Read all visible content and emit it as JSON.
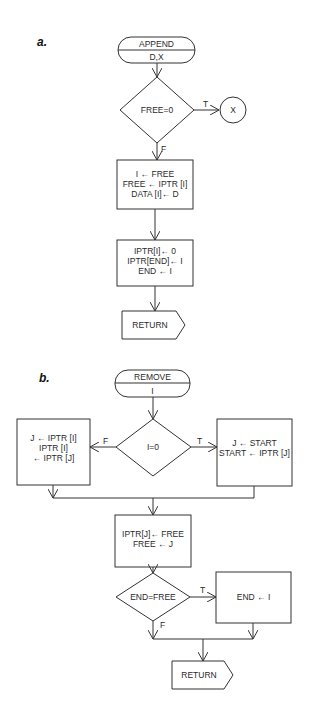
{
  "diagram_a": {
    "label": "a.",
    "start": {
      "title": "APPEND",
      "params": "D,X"
    },
    "decision": {
      "text": "FREE=0",
      "true_label": "T",
      "false_label": "F"
    },
    "connector": {
      "text": "X"
    },
    "box1": {
      "lines": [
        "I ← FREE",
        "FREE ← IPTR [I]",
        "DATA [I]← D"
      ]
    },
    "box2": {
      "lines": [
        "IPTR[I]← 0",
        "IPTR[END]← I",
        "END ← I"
      ]
    },
    "end": {
      "text": "RETURN"
    }
  },
  "diagram_b": {
    "label": "b.",
    "start": {
      "title": "REMOVE",
      "params": "I"
    },
    "decision1": {
      "text": "I=0",
      "true_label": "T",
      "false_label": "F"
    },
    "false_box": {
      "lines": [
        "J ← IPTR [I]",
        "IPTR [I]",
        "← IPTR [J]"
      ]
    },
    "true_box": {
      "lines": [
        "J ← START",
        "START ← IPTR [J]"
      ]
    },
    "box3": {
      "lines": [
        "IPTR[J]← FREE",
        "FREE ← J"
      ]
    },
    "decision2": {
      "text": "END=FREE",
      "true_label": "T",
      "false_label": "F"
    },
    "true_box2": {
      "lines": [
        "END ← I"
      ]
    },
    "end": {
      "text": "RETURN"
    }
  }
}
